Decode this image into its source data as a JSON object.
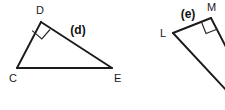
{
  "canvas": {
    "width": 225,
    "height": 110,
    "background": "#ffffff",
    "stroke_color": "#1b1b1b",
    "label_color": "#1a1a1a",
    "tag_color": "#111111"
  },
  "figures": [
    {
      "tag": "(d)",
      "tag_x": 78,
      "tag_y": 34,
      "shape": "right-triangle",
      "right_angle_at": "D",
      "vertices": [
        {
          "name": "C",
          "x": 17,
          "y": 68,
          "label_x": 9,
          "label_y": 82
        },
        {
          "name": "D",
          "x": 41,
          "y": 22,
          "label_x": 36,
          "label_y": 14
        },
        {
          "name": "E",
          "x": 112,
          "y": 68,
          "label_x": 114,
          "label_y": 82
        }
      ],
      "edges": [
        {
          "from": "C",
          "to": "D"
        },
        {
          "from": "D",
          "to": "E"
        },
        {
          "from": "C",
          "to": "E"
        }
      ],
      "right_angle_mark": "M 32.2 30.6 L 41.8 39.0 L 50.0 29.5"
    },
    {
      "tag": "(e)",
      "tag_x": 188,
      "tag_y": 18,
      "shape": "right-triangle",
      "right_angle_at": "M",
      "cropped": true,
      "vertices": [
        {
          "name": "L",
          "x": 173,
          "y": 33,
          "label_x": 160,
          "label_y": 37
        },
        {
          "name": "M",
          "x": 211,
          "y": 18,
          "label_x": 207,
          "label_y": 11
        }
      ],
      "edges": [
        {
          "from": "L",
          "to": "M"
        },
        {
          "from": "M",
          "to": "edge-right"
        },
        {
          "from": "L",
          "to": "edge-bottom-right"
        }
      ],
      "right_angle_mark": "M 201.5 22.0 L 206.0 33.5 L 217.5 29.0"
    }
  ]
}
